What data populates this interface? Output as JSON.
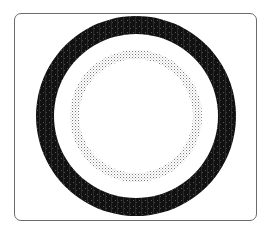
{
  "figure": {
    "frame": {
      "stroke": "#6b6b6b",
      "background": "#ffffff"
    },
    "center": {
      "x": 136,
      "y": 116
    },
    "outer_ring": {
      "label": "solid-black-ring",
      "outer_radius": 100,
      "inner_radius": 82,
      "color": "#111111"
    },
    "inner_ring": {
      "label": "dotted-gray-ring",
      "outer_radius": 66,
      "inner_radius": 57,
      "color": "#7a7a7a"
    }
  }
}
